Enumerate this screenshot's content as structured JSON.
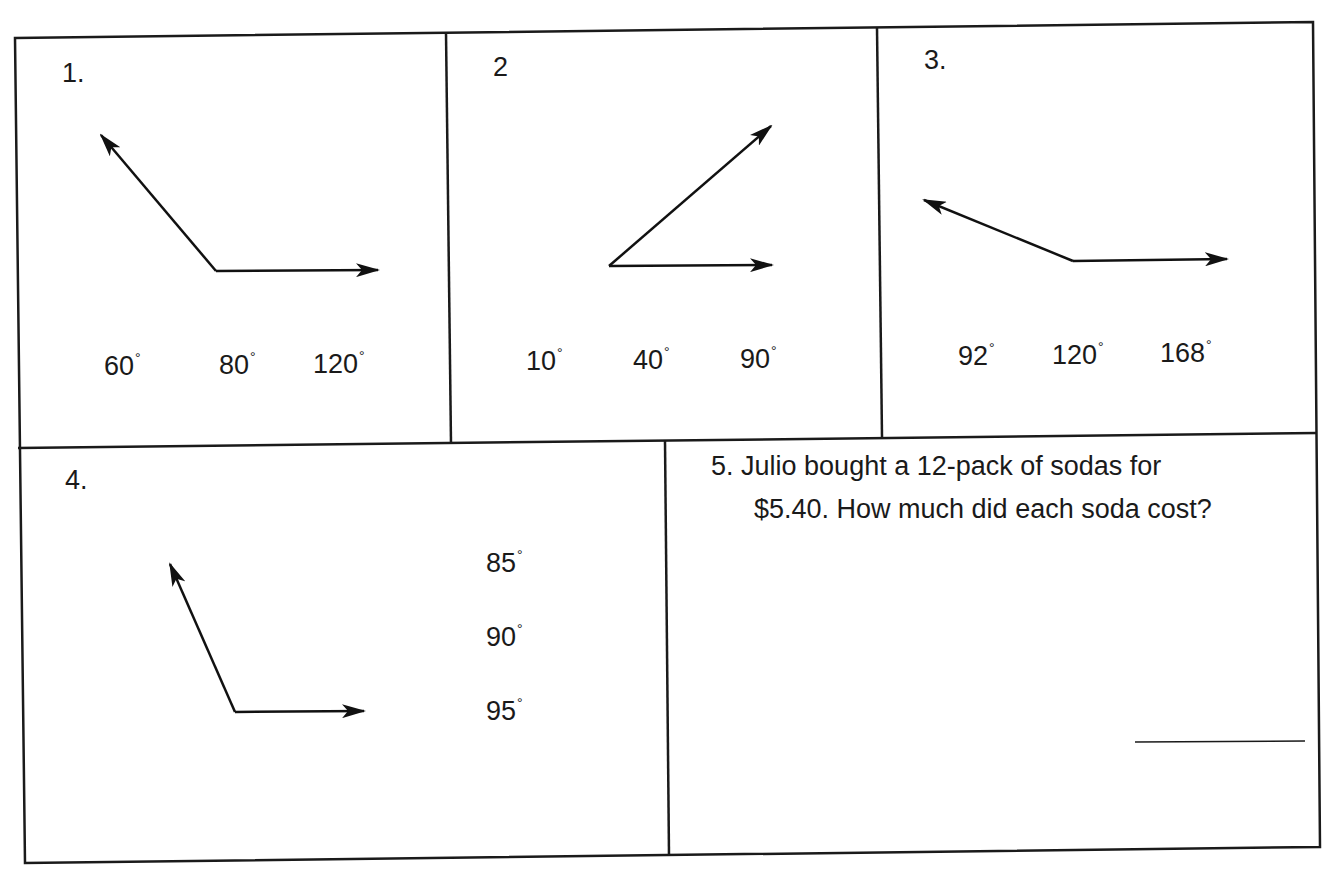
{
  "worksheet": {
    "problems": [
      {
        "number": "1.",
        "type": "angle-estimate",
        "choices": [
          {
            "value": "60",
            "unit": "°"
          },
          {
            "value": "80",
            "unit": "°"
          },
          {
            "value": "120",
            "unit": "°"
          }
        ]
      },
      {
        "number": "2",
        "type": "angle-estimate",
        "choices": [
          {
            "value": "10",
            "unit": "°"
          },
          {
            "value": "40",
            "unit": "°"
          },
          {
            "value": "90",
            "unit": "°"
          }
        ]
      },
      {
        "number": "3.",
        "type": "angle-estimate",
        "choices": [
          {
            "value": "92",
            "unit": "°"
          },
          {
            "value": "120",
            "unit": "°"
          },
          {
            "value": "168",
            "unit": "°"
          }
        ]
      },
      {
        "number": "4.",
        "type": "angle-estimate",
        "choices": [
          {
            "value": "85",
            "unit": "°"
          },
          {
            "value": "90",
            "unit": "°"
          },
          {
            "value": "95",
            "unit": "°"
          }
        ]
      },
      {
        "number": "5.",
        "type": "word-problem",
        "line1": "Julio bought a 12-pack of sodas for",
        "line2": "$5.40.  How much did each soda cost?",
        "answer": ""
      }
    ]
  }
}
